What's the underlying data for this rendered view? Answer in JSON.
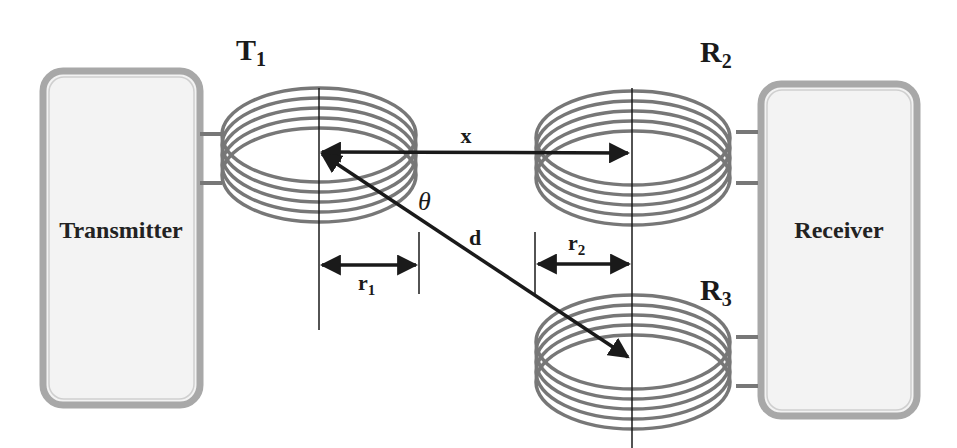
{
  "diagram": {
    "blocks": {
      "transmitter": {
        "label": "Transmitter"
      },
      "receiver": {
        "label": "Receiver"
      }
    },
    "coils": [
      {
        "id": "T1",
        "label_main": "T",
        "label_sub": "1",
        "role": "transmitter coil"
      },
      {
        "id": "R2",
        "label_main": "R",
        "label_sub": "2",
        "role": "receiver coil (coaxial)"
      },
      {
        "id": "R3",
        "label_main": "R",
        "label_sub": "3",
        "role": "receiver coil (offset)"
      }
    ],
    "dimensions": {
      "x": {
        "label": "x"
      },
      "d": {
        "label": "d"
      },
      "theta": {
        "label": "θ"
      },
      "r1": {
        "label_main": "r",
        "label_sub": "1"
      },
      "r2": {
        "label_main": "r",
        "label_sub": "2"
      }
    },
    "colors": {
      "coil": "#777777",
      "box_border": "#a8a8a8",
      "box_fill": "#f3f3f3",
      "arrow": "#1a1a1a",
      "text": "#1a1a1a"
    }
  }
}
